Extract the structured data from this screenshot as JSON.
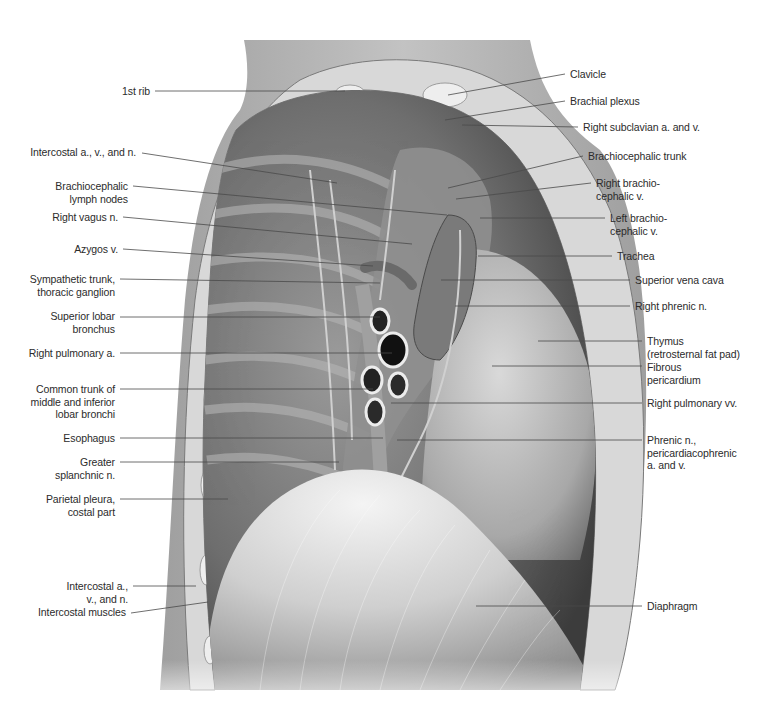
{
  "figure": {
    "colors": {
      "background": "#ffffff",
      "label_text": "#2b2b2b",
      "leader_line": "#4a4a4a",
      "skin_shadow": "#9a9a9a",
      "thoracic_wall": "#d9d9d9",
      "rib_section": "#eeeeee",
      "cavity_dark": "#5c5c5c",
      "mediastinum": "#8f8f8f",
      "pericardium": "#b4b4b4",
      "diaphragm_light": "#e6e6e6",
      "diaphragm_mid": "#bdbdbd"
    }
  },
  "labels_left": [
    {
      "id": "first-rib",
      "text": "1st rib"
    },
    {
      "id": "intercostal-avn-upper",
      "text": "Intercostal a., v., and n."
    },
    {
      "id": "brachiocephalic-lymph-nodes",
      "text": "Brachiocephalic\nlymph nodes"
    },
    {
      "id": "right-vagus-n",
      "text": "Right vagus n."
    },
    {
      "id": "azygos-v",
      "text": "Azygos v."
    },
    {
      "id": "sympathetic-trunk",
      "text": "Sympathetic trunk,\nthoracic ganglion"
    },
    {
      "id": "superior-lobar-bronchus",
      "text": "Superior lobar\nbronchus"
    },
    {
      "id": "right-pulmonary-a",
      "text": "Right pulmonary a."
    },
    {
      "id": "common-trunk-bronchi",
      "text": "Common trunk of\nmiddle and inferior\nlobar bronchi"
    },
    {
      "id": "esophagus",
      "text": "Esophagus"
    },
    {
      "id": "greater-splanchnic-n",
      "text": "Greater\nsplanchnic n."
    },
    {
      "id": "parietal-pleura-costal",
      "text": "Parietal pleura,\ncostal part"
    },
    {
      "id": "intercostal-avn-lower",
      "text": "Intercostal a.,\nv., and n."
    },
    {
      "id": "intercostal-muscles",
      "text": "Intercostal muscles"
    }
  ],
  "labels_right": [
    {
      "id": "clavicle",
      "text": "Clavicle"
    },
    {
      "id": "brachial-plexus",
      "text": "Brachial plexus"
    },
    {
      "id": "right-subclavian-av",
      "text": "Right subclavian a. and v."
    },
    {
      "id": "brachiocephalic-trunk",
      "text": "Brachiocephalic trunk"
    },
    {
      "id": "right-brachiocephalic-v",
      "text": "Right brachio-\ncephalic v."
    },
    {
      "id": "left-brachiocephalic-v",
      "text": "Left brachio-\ncephalic v."
    },
    {
      "id": "trachea",
      "text": "Trachea"
    },
    {
      "id": "superior-vena-cava",
      "text": "Superior vena cava"
    },
    {
      "id": "right-phrenic-n",
      "text": "Right phrenic n."
    },
    {
      "id": "thymus",
      "text": "Thymus\n(retrosternal fat pad)"
    },
    {
      "id": "fibrous-pericardium",
      "text": "Fibrous\npericardium"
    },
    {
      "id": "right-pulmonary-vv",
      "text": "Right pulmonary vv."
    },
    {
      "id": "phrenic-n-pericardiacophrenic",
      "text": "Phrenic n.,\npericardiacophrenic\na. and v."
    },
    {
      "id": "diaphragm",
      "text": "Diaphragm"
    }
  ]
}
